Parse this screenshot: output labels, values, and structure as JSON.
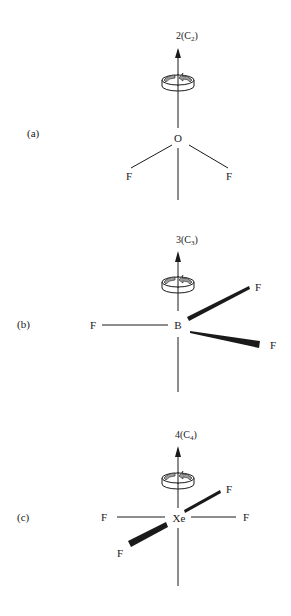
{
  "figure": {
    "panels": [
      {
        "id": "a",
        "label": "(a)",
        "molecule": "OF2",
        "axis": {
          "order": "2",
          "symbol": "C",
          "subscript": "2",
          "prefix": "2(",
          "suffix": ")"
        },
        "central_atom": "O",
        "ligands": [
          {
            "symbol": "F",
            "position": "lower-left",
            "bond": "plain"
          },
          {
            "symbol": "F",
            "position": "lower-right",
            "bond": "plain"
          }
        ]
      },
      {
        "id": "b",
        "label": "(b)",
        "molecule": "BF3",
        "axis": {
          "order": "3",
          "symbol": "C",
          "subscript": "3",
          "prefix": "3(",
          "suffix": ")"
        },
        "central_atom": "B",
        "ligands": [
          {
            "symbol": "F",
            "position": "left",
            "bond": "plain"
          },
          {
            "symbol": "F",
            "position": "upper-right",
            "bond": "wedge"
          },
          {
            "symbol": "F",
            "position": "lower-right",
            "bond": "wedge"
          }
        ]
      },
      {
        "id": "c",
        "label": "(c)",
        "molecule": "XeF4",
        "axis": {
          "order": "4",
          "symbol": "C",
          "subscript": "4",
          "prefix": "4(",
          "suffix": ")"
        },
        "central_atom": "Xe",
        "ligands": [
          {
            "symbol": "F",
            "position": "left",
            "bond": "plain"
          },
          {
            "symbol": "F",
            "position": "right",
            "bond": "plain"
          },
          {
            "symbol": "F",
            "position": "upper-right",
            "bond": "wedge"
          },
          {
            "symbol": "F",
            "position": "lower-left",
            "bond": "wedge"
          }
        ]
      }
    ],
    "colors": {
      "ink": "#1a1a1a",
      "arrow_fill": "#9a9a9a",
      "background": "#ffffff"
    }
  }
}
